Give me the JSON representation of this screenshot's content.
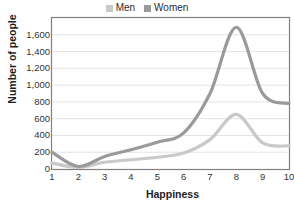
{
  "chart_data": {
    "type": "line",
    "title": "",
    "subtitle": "",
    "xlabel": "Happiness",
    "ylabel": "Number of people",
    "x": [
      1,
      2,
      3,
      4,
      5,
      6,
      7,
      8,
      9,
      10
    ],
    "xtick_labels": [
      "1",
      "2",
      "3",
      "4",
      "5",
      "6",
      "7",
      "8",
      "9",
      "10"
    ],
    "ytick_labels": [
      "0",
      "200",
      "400",
      "600",
      "800",
      "1,000",
      "1,200",
      "1,400",
      "1,600"
    ],
    "ytick_values": [
      0,
      200,
      400,
      600,
      800,
      1000,
      1200,
      1400,
      1600
    ],
    "xlim": [
      1,
      10
    ],
    "ylim": [
      0,
      1800
    ],
    "grid": "horizontal",
    "legend_position": "top-center",
    "smoothed": true,
    "series": [
      {
        "name": "Men",
        "color": "#c9c9c9",
        "values": [
          70,
          20,
          80,
          110,
          140,
          190,
          350,
          650,
          310,
          275
        ]
      },
      {
        "name": "Women",
        "color": "#9a9a9a",
        "values": [
          200,
          30,
          150,
          230,
          320,
          430,
          900,
          1690,
          900,
          780
        ]
      }
    ]
  },
  "legend": {
    "items": [
      {
        "label": "Men",
        "color": "#c9c9c9"
      },
      {
        "label": "Women",
        "color": "#9a9a9a"
      }
    ]
  },
  "style": {
    "plot_border_color": "#808080",
    "gridline_color": "#e4e4e4",
    "tick_text_color": "#333333",
    "title_text_color": "#1d1d1d",
    "background": "#ffffff"
  }
}
